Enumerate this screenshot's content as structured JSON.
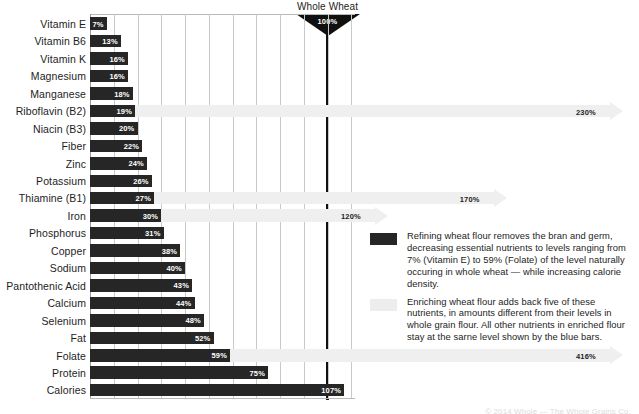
{
  "chart_data": {
    "type": "bar",
    "xlabel": "",
    "ylabel": "",
    "orientation": "horizontal",
    "xlim": [
      0,
      110
    ],
    "grid": true,
    "gridline_step_percent": 10,
    "reference_line": {
      "label": "Whole Wheat",
      "value_label": "100%",
      "value": 100
    },
    "categories": [
      "Vitamin E",
      "Vitamin B6",
      "Vitamin K",
      "Magnesium",
      "Manganese",
      "Riboflavin (B2)",
      "Niacin (B3)",
      "Fiber",
      "Zinc",
      "Potassium",
      "Thiamine (B1)",
      "Iron",
      "Phosphorus",
      "Copper",
      "Sodium",
      "Pantothenic Acid",
      "Calcium",
      "Selenium",
      "Fat",
      "Folate",
      "Protein",
      "Calories"
    ],
    "values": [
      7,
      13,
      16,
      16,
      18,
      19,
      20,
      22,
      24,
      26,
      27,
      30,
      31,
      38,
      40,
      43,
      44,
      48,
      52,
      59,
      75,
      107
    ],
    "value_labels": [
      "7%",
      "13%",
      "16%",
      "16%",
      "18%",
      "19%",
      "20%",
      "22%",
      "24%",
      "26%",
      "27%",
      "30%",
      "31%",
      "38%",
      "40%",
      "43%",
      "44%",
      "48%",
      "52%",
      "59%",
      "75%",
      "107%"
    ],
    "enrichment": [
      {
        "category": "Riboflavin (B2)",
        "index": 5,
        "value": 230,
        "label": "230%"
      },
      {
        "category": "Thiamine (B1)",
        "index": 10,
        "value": 170,
        "label": "170%"
      },
      {
        "category": "Iron",
        "index": 11,
        "value": 120,
        "label": "120%"
      },
      {
        "category": "Folate",
        "index": 19,
        "value": 416,
        "label": "416%"
      }
    ],
    "legend": [
      {
        "swatch": "dark",
        "color": "#262626",
        "text": "Refining wheat flour removes the bran and germ, decreasing essential nutrients to levels ranging from 7% (Vitamin E) to 59% (Folate) of the level naturally occuring in whole wheat — while increasing calorie density."
      },
      {
        "swatch": "light",
        "color": "#ededed",
        "text": "Enriching wheat flour adds back five of these nutrients, in amounts different from their levels in whole grain flour. All other nutrients in enriched flour stay at the sarne level shown by the blue bars."
      }
    ],
    "legend_position": "right"
  },
  "colors": {
    "bar": "#262626",
    "arrow": "#ededed",
    "grid": "#c9c9c9",
    "reference": "#101010",
    "text": "#1d1d1d",
    "bar_label": "#ffffff",
    "background": "#ffffff"
  },
  "footer": {
    "credit": "© 2014  Whole — The Whole Grains Co."
  }
}
